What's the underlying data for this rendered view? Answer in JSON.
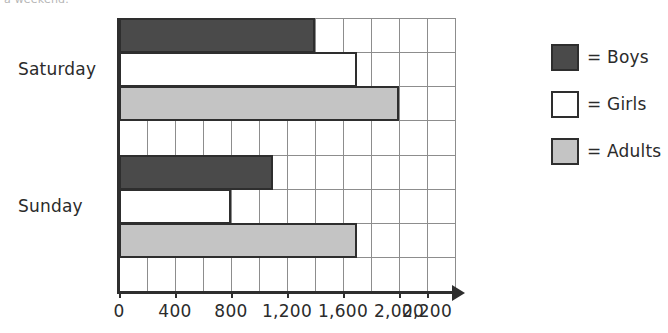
{
  "caption_partial": "a weekend.",
  "chart_data": {
    "type": "bar",
    "orientation": "horizontal",
    "title": "",
    "xlabel": "",
    "ylabel": "",
    "categories": [
      "Saturday",
      "Sunday"
    ],
    "series": [
      {
        "name": "Boys",
        "values": [
          1400,
          1100
        ],
        "color": "#4a4a4a"
      },
      {
        "name": "Girls",
        "values": [
          1700,
          800
        ],
        "color": "#ffffff"
      },
      {
        "name": "Adults",
        "values": [
          2000,
          1700
        ],
        "color": "#c4c4c4"
      }
    ],
    "xlim": [
      0,
      2400
    ],
    "xticks": [
      0,
      400,
      800,
      1200,
      1600,
      2000,
      2200
    ],
    "xtick_labels": [
      "0",
      "400",
      "800",
      "1,200",
      "1,600",
      "2,000",
      "2,200"
    ],
    "minor_gridline_step": 200,
    "grid": true,
    "legend_position": "right"
  },
  "axis": {
    "tick_labels": [
      "0",
      "400",
      "800",
      "1,200",
      "1,600",
      "2,000",
      "2,200"
    ],
    "category_labels": [
      "Saturday",
      "Sunday"
    ]
  },
  "legend": {
    "items": [
      {
        "label": "= Boys",
        "swatch": "dark-gray"
      },
      {
        "label": "= Girls",
        "swatch": "white"
      },
      {
        "label": "= Adults",
        "swatch": "light-gray"
      }
    ]
  },
  "colors": {
    "boys": "#4a4a4a",
    "girls": "#ffffff",
    "adults": "#c4c4c4",
    "axis": "#2e2e2e",
    "grid": "#8d8d8d"
  }
}
